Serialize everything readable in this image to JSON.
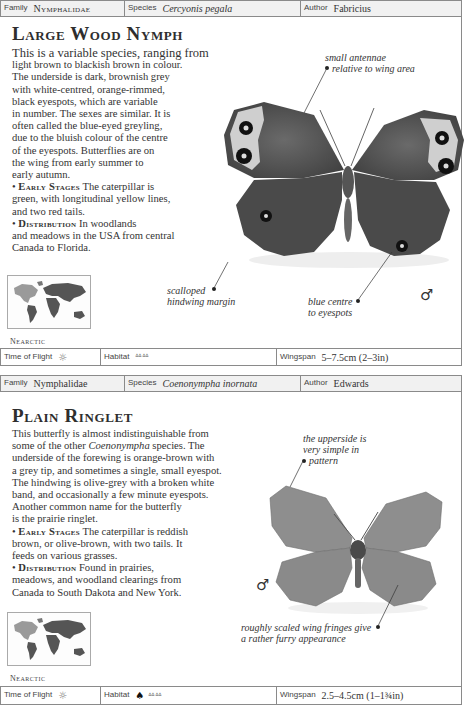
{
  "page": {
    "entries": [
      {
        "header": {
          "family_label": "Family",
          "family_value": "Nymphalidae",
          "species_label": "Species",
          "species_value": "Cercyonis pegala",
          "author_label": "Author",
          "author_value": "Fabricius"
        },
        "title": "Large Wood Nymph",
        "description": [
          "This is a variable species, ranging from",
          "light brown to blackish brown in colour.",
          "The underside is dark, brownish grey",
          "with white-centred, orange-rimmed,",
          "black eyespots, which are variable",
          "in number. The sexes are similar. It is",
          "often called the blue-eyed greyling,",
          "due to the bluish colour of the centre",
          "of the eyespots. Butterflies are on",
          "the wing from early summer to",
          "early autumn."
        ],
        "early_stages_label": "Early Stages",
        "early_stages_text": [
          " The caterpillar is",
          "green, with longitudinal yellow lines,",
          "and two red tails."
        ],
        "distribution_label": "Distribution",
        "distribution_text": [
          " In woodlands",
          "and meadows in the USA from central",
          "Canada to Florida."
        ],
        "region": "Nearctic",
        "annotations": {
          "top": [
            "small antennae",
            "relative to wing area"
          ],
          "left": [
            "scalloped",
            "hindwing margin"
          ],
          "right": [
            "blue centre",
            "to eyespots"
          ]
        },
        "sex_symbol": "♂",
        "footer": {
          "time_label": "Time of Flight",
          "time_icon": "sun-icon",
          "habitat_label": "Habitat",
          "habitat_icons": [
            "grass-icon"
          ],
          "wingspan_label": "Wingspan",
          "wingspan_value": "5–7.5cm (2–3in)"
        }
      },
      {
        "header": {
          "family_label": "Family",
          "family_value": "Nymphalidae",
          "species_label": "Species",
          "species_value": "Coenonympha inornata",
          "author_label": "Author",
          "author_value": "Edwards"
        },
        "title": "Plain Ringlet",
        "description_parts": {
          "line1": "This butterfly is almost indistinguishable from",
          "line2_pre": "some of the other ",
          "line2_ital": "Coenonympha",
          "line2_post": " species. The",
          "rest": [
            "underside of the forewing is orange-brown with",
            "a grey tip, and sometimes a single, small eyespot.",
            "The hindwing is olive-grey with a broken white",
            "band, and occasionally a few minute eyespots.",
            "Another common name for the butterfly",
            "is the prairie ringlet."
          ]
        },
        "early_stages_label": "Early Stages",
        "early_stages_text": [
          " The caterpillar is reddish",
          "brown, or olive-brown, with two tails. It",
          "feeds on various grasses."
        ],
        "distribution_label": "Distribution",
        "distribution_text": [
          " Found in prairies,",
          "meadows, and woodland clearings from",
          "Canada to South Dakota and New York."
        ],
        "region": "Nearctic",
        "annotations": {
          "top": [
            "the upperside is",
            "very simple in",
            "pattern"
          ],
          "bottom": [
            "roughly scaled wing fringes give",
            "a rather furry appearance"
          ]
        },
        "sex_symbol": "♂",
        "footer": {
          "time_label": "Time of Flight",
          "time_icon": "sun-icon",
          "habitat_label": "Habitat",
          "habitat_icons": [
            "tree-icon",
            "grass-icon"
          ],
          "wingspan_label": "Wingspan",
          "wingspan_value": "2.5–4.5cm (1–1¾in)"
        }
      }
    ]
  }
}
